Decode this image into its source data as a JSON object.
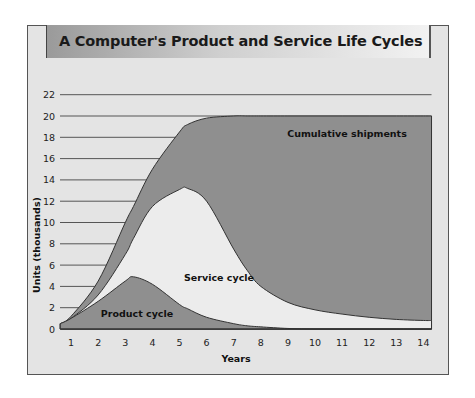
{
  "chart_data": {
    "type": "area",
    "title": "A Computer's Product and Service Life Cycles",
    "xlabel": "Years",
    "ylabel": "Units (thousands)",
    "x_ticks": [
      "1",
      "2",
      "3",
      "4",
      "5",
      "6",
      "7",
      "8",
      "9",
      "10",
      "11",
      "12",
      "13",
      "14"
    ],
    "y_ticks": [
      "0",
      "2",
      "4",
      "6",
      "8",
      "10",
      "12",
      "14",
      "16",
      "18",
      "20",
      "22"
    ],
    "xlim": [
      0.6,
      14.3
    ],
    "ylim": [
      0,
      22
    ],
    "grid": "horizontal lines at each y tick (left of curves)",
    "x": [
      0.6,
      1,
      2,
      3,
      3.3,
      4,
      5,
      5.3,
      6,
      7,
      7.5,
      8,
      9,
      10,
      11,
      12,
      13,
      14,
      14.3
    ],
    "series": [
      {
        "name": "Cumulative shipments",
        "color": "#8f8f8f",
        "values": [
          0.5,
          1.2,
          4.5,
          10.0,
          11.5,
          15.0,
          18.5,
          19.2,
          19.8,
          20.0,
          20.0,
          20.0,
          20.0,
          20.0,
          20.0,
          20.0,
          20.0,
          20.0,
          20.0
        ]
      },
      {
        "name": "Service cycle",
        "color": "#ececec",
        "values": [
          0.5,
          1.0,
          3.2,
          7.0,
          8.5,
          11.5,
          13.1,
          13.2,
          12.0,
          7.5,
          5.5,
          4.0,
          2.5,
          1.8,
          1.4,
          1.1,
          0.9,
          0.8,
          0.8
        ]
      },
      {
        "name": "Product cycle",
        "color": "#8f8f8f",
        "values": [
          0.5,
          1.0,
          2.6,
          4.5,
          4.9,
          4.2,
          2.3,
          1.9,
          1.1,
          0.5,
          0.3,
          0.2,
          0.05,
          0,
          0,
          0,
          0,
          0,
          0
        ]
      }
    ],
    "annotations": [
      "Cumulative shipments",
      "Service cycle",
      "Product cycle"
    ]
  },
  "labels": {
    "title": "A Computer's Product and Service Life Cycles",
    "xlabel": "Years",
    "ylabel": "Units (thousands)",
    "cumulative": "Cumulative shipments",
    "service": "Service cycle",
    "product": "Product cycle"
  }
}
